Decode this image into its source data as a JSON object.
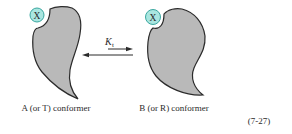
{
  "diagram": {
    "equation_number": "(7-27)",
    "equilibrium_constant": {
      "symbol": "K",
      "subscript": "t"
    },
    "colors": {
      "protein_fill": "#b9b9b9",
      "protein_stroke": "#2b2b2b",
      "ligand_fill": "#a9e6e0",
      "ligand_stroke": "#3aa7a0",
      "arrow": "#2b2b2b",
      "text": "#2a2a2a"
    },
    "conformers": [
      {
        "id": "A",
        "label": "A (or T) conformer",
        "ligand": "X"
      },
      {
        "id": "B",
        "label": "B (or R) conformer",
        "ligand": "X"
      }
    ]
  }
}
